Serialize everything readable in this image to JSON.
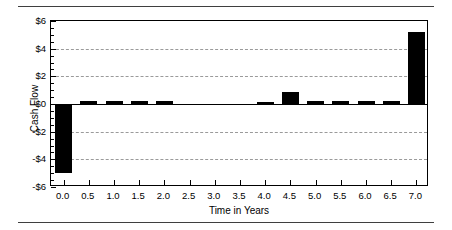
{
  "chart_data": {
    "type": "bar",
    "title": "",
    "xlabel": "Time in Years",
    "ylabel": "Cash Flow",
    "categories": [
      "0.0",
      "0.5",
      "1.0",
      "1.5",
      "2.0",
      "2.5",
      "3.0",
      "3.5",
      "4.0",
      "4.5",
      "5.0",
      "5.5",
      "6.0",
      "6.5",
      "7.0"
    ],
    "values": [
      -5.0,
      0.25,
      0.25,
      0.25,
      0.25,
      0,
      0,
      0,
      0.15,
      0.9,
      0.25,
      0.25,
      0.25,
      0.25,
      5.2
    ],
    "x": [
      0.0,
      0.5,
      1.0,
      1.5,
      2.0,
      2.5,
      3.0,
      3.5,
      4.0,
      4.5,
      5.0,
      5.5,
      6.0,
      6.5,
      7.0
    ],
    "xlim": [
      -0.25,
      7.25
    ],
    "ylim": [
      -6,
      6
    ],
    "ytick_labels": [
      "$6",
      "$4",
      "$2",
      "$0",
      "-$2",
      "-$4",
      "-$6"
    ],
    "ytick_values": [
      6,
      4,
      2,
      0,
      -2,
      -4,
      -6
    ],
    "xtick_labels": [
      "0.0",
      "0.5",
      "1.0",
      "1.5",
      "2.0",
      "2.5",
      "3.0",
      "3.5",
      "4.0",
      "4.5",
      "5.0",
      "5.5",
      "6.0",
      "6.5",
      "7.0"
    ],
    "gridlines_y": [
      4,
      2,
      -2,
      -4
    ],
    "grid": true,
    "grid_style": "dashed",
    "legend": null,
    "bar_color": "#000000",
    "axis_color": "#000000",
    "grid_color": "#9a9a9a",
    "background": "#ffffff"
  },
  "figure": {
    "rule_top": "",
    "rule_bottom": ""
  }
}
